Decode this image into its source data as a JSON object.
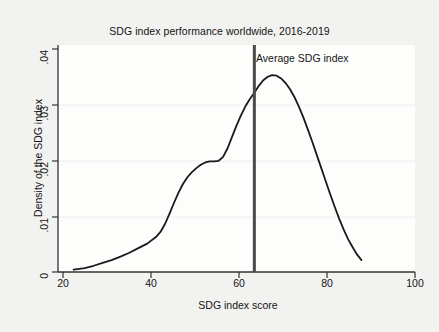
{
  "chart_data": {
    "type": "line",
    "title": "SDG index performance worldwide, 2016-2019",
    "xlabel": "SDG index score",
    "ylabel": "Density of the SDG index",
    "xlim": [
      20,
      100
    ],
    "ylim": [
      0,
      0.04
    ],
    "xticks": [
      "20",
      "40",
      "60",
      "80",
      "100"
    ],
    "xtick_values": [
      20,
      40,
      60,
      80,
      100
    ],
    "yticks": [
      "0",
      ".01",
      ".02",
      ".03",
      ".04"
    ],
    "ytick_values": [
      0,
      0.01,
      0.02,
      0.03,
      0.04
    ],
    "grid": "horizontal-faint",
    "legend": "none",
    "series": [
      {
        "name": "Kernel density of SDG index score",
        "color": "#1a1a1a",
        "x": [
          23.5,
          26,
          28,
          30,
          32,
          34,
          36,
          38,
          40,
          42,
          43,
          44,
          45,
          46,
          47,
          48,
          49,
          50,
          51,
          52,
          53,
          54,
          55,
          56,
          57,
          58,
          59,
          60,
          61,
          62,
          63,
          64,
          65,
          66,
          67,
          68,
          69,
          70,
          71,
          72,
          73,
          74,
          75,
          76,
          77,
          78,
          79,
          80,
          81,
          82,
          83,
          84,
          85,
          86,
          87,
          88
        ],
        "y": [
          0.0004,
          0.0007,
          0.0011,
          0.0016,
          0.0021,
          0.0027,
          0.0034,
          0.0042,
          0.005,
          0.0062,
          0.0071,
          0.0085,
          0.0103,
          0.0122,
          0.014,
          0.0155,
          0.0167,
          0.0176,
          0.0183,
          0.0189,
          0.0193,
          0.0195,
          0.0195,
          0.0196,
          0.0203,
          0.0218,
          0.0238,
          0.0258,
          0.0276,
          0.0292,
          0.0305,
          0.0316,
          0.0328,
          0.0338,
          0.0344,
          0.0347,
          0.0346,
          0.0341,
          0.0333,
          0.0322,
          0.0308,
          0.0291,
          0.0272,
          0.0251,
          0.0229,
          0.0206,
          0.0183,
          0.016,
          0.0137,
          0.0115,
          0.0094,
          0.0075,
          0.0058,
          0.0044,
          0.0031,
          0.0021
        ]
      }
    ],
    "annotations": [
      {
        "name": "average-sdg-index",
        "label": "Average SDG index",
        "type": "vline",
        "x_value": 64,
        "color": "#4a4a4a",
        "line_width": 3
      }
    ]
  },
  "chart": {
    "title": "SDG index performance worldwide, 2016-2019",
    "x_axis_label": "SDG index score",
    "y_axis_label": "Density of the SDG index",
    "annotation_label": "Average SDG index",
    "x_ticks": [
      "20",
      "40",
      "60",
      "80",
      "100"
    ],
    "y_ticks": [
      "0",
      ".01",
      ".02",
      ".03",
      ".04"
    ],
    "colors": {
      "curve": "#1a1a1a",
      "vline": "#4a4a4a",
      "axis": "#333333",
      "grid": "#eeeeee",
      "background": "#f2f2f0",
      "plot_background": "#fdfdfc"
    }
  }
}
